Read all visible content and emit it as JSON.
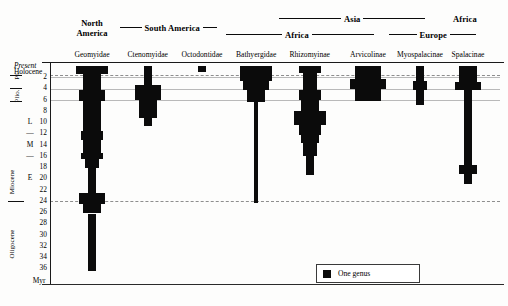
{
  "regions_row1": [
    {
      "label": "Asia",
      "rule_left": 62,
      "rule_right": 62,
      "center": 352,
      "top": 13
    },
    {
      "label": "Africa",
      "rule_left": 0,
      "rule_right": 0,
      "center": 465,
      "top": 13
    }
  ],
  "regions_row2": [
    {
      "label": "Africa",
      "rule_left": 56,
      "rule_right": 62,
      "center": 300,
      "top": 29
    },
    {
      "label": "Europe",
      "rule_left": 28,
      "rule_right": 26,
      "center": 432,
      "top": 29
    }
  ],
  "regions_row3": [
    {
      "label": "South America",
      "rule_left": 22,
      "rule_right": 14,
      "center": 168,
      "top": 22
    }
  ],
  "north_america": {
    "line1": "North",
    "line2": "America",
    "center": 92,
    "top": 19
  },
  "columns": [
    {
      "name": "Geomyidae",
      "center": 92
    },
    {
      "name": "Ctenomyidae",
      "center": 148
    },
    {
      "name": "Octodontidae",
      "center": 202
    },
    {
      "name": "Bathyergidae",
      "center": 256
    },
    {
      "name": "Rhizomyinae",
      "center": 310
    },
    {
      "name": "Arvicolinae",
      "center": 368
    },
    {
      "name": "Myospalacinae",
      "center": 420
    },
    {
      "name": "Spalacinae",
      "center": 468
    }
  ],
  "axis": {
    "unit": "Myr",
    "present": "Present",
    "holocene": "Holocene",
    "numeric_ticks": [
      2,
      4,
      6,
      8,
      10,
      12,
      14,
      16,
      18,
      20,
      22,
      24,
      26,
      28,
      30,
      32,
      34,
      36
    ],
    "epochs": [
      {
        "label": "Pl.",
        "rotated": true
      },
      {
        "label": "Plio.",
        "rotated": true
      },
      {
        "label": "Miocene",
        "rotated": true
      },
      {
        "label": "Oligocene",
        "rotated": true
      }
    ],
    "miocene_subdivisions": [
      {
        "label": "L",
        "at_myr": 10
      },
      {
        "label": "—",
        "at_myr": 12
      },
      {
        "label": "M",
        "at_myr": 14
      },
      {
        "label": "—",
        "at_myr": 16
      },
      {
        "label": "E",
        "at_myr": 20
      }
    ],
    "gridlines_myr": [
      2,
      4,
      6,
      24
    ],
    "holocene_gridline": true
  },
  "legend": {
    "swatch_label": "One genus"
  },
  "chart_data": {
    "type": "area",
    "title": "",
    "xlabel": "",
    "ylabel": "Myr",
    "ylim": [
      0,
      37
    ],
    "y_direction": "inverted",
    "unit": "Myr",
    "legend_note": "One genus",
    "categories": [
      "Geomyidae",
      "Ctenomyidae",
      "Octodontidae",
      "Bathyergidae",
      "Rhizomyinae",
      "Arvicolinae",
      "Myospalacinae",
      "Spalacinae"
    ],
    "regions": {
      "Geomyidae": "North America",
      "Ctenomyidae": "South America",
      "Octodontidae": "South America",
      "Bathyergidae": "Africa",
      "Rhizomyinae": "Africa/Asia",
      "Arvicolinae": "Asia",
      "Myospalacinae": "Asia/Europe",
      "Spalacinae": "Africa/Europe"
    },
    "series": [
      {
        "name": "Geomyidae",
        "center": 92,
        "spans": [
          {
            "from": 0.0,
            "to": 1.4,
            "genera": 7
          },
          {
            "from": 1.4,
            "to": 4.2,
            "genera": 4
          },
          {
            "from": 4.2,
            "to": 6.3,
            "genera": 6
          },
          {
            "from": 6.3,
            "to": 11.6,
            "genera": 4
          },
          {
            "from": 11.6,
            "to": 13.2,
            "genera": 5
          },
          {
            "from": 13.2,
            "to": 15.4,
            "genera": 4
          },
          {
            "from": 15.4,
            "to": 16.6,
            "genera": 5
          },
          {
            "from": 16.6,
            "to": 18.2,
            "genera": 3
          },
          {
            "from": 18.2,
            "to": 22.6,
            "genera": 2
          },
          {
            "from": 22.6,
            "to": 24.6,
            "genera": 6
          },
          {
            "from": 24.6,
            "to": 26.2,
            "genera": 4
          },
          {
            "from": 26.2,
            "to": 36.4,
            "genera": 2
          }
        ]
      },
      {
        "name": "Ctenomyidae",
        "center": 148,
        "spans": [
          {
            "from": 0.0,
            "to": 3.3,
            "genera": 2
          },
          {
            "from": 3.3,
            "to": 6.1,
            "genera": 6
          },
          {
            "from": 6.1,
            "to": 9.2,
            "genera": 4
          },
          {
            "from": 9.2,
            "to": 10.6,
            "genera": 2
          }
        ]
      },
      {
        "name": "Octodontidae",
        "center": 202,
        "spans": [
          {
            "from": 0.0,
            "to": 1.1,
            "genera": 2
          }
        ]
      },
      {
        "name": "Bathyergidae",
        "center": 256,
        "spans": [
          {
            "from": 0.0,
            "to": 2.6,
            "genera": 7
          },
          {
            "from": 2.6,
            "to": 4.3,
            "genera": 6
          },
          {
            "from": 4.3,
            "to": 6.4,
            "genera": 4
          },
          {
            "from": 6.4,
            "to": 24.3,
            "genera": 1
          }
        ]
      },
      {
        "name": "Rhizomyinae",
        "center": 310,
        "spans": [
          {
            "from": 0.0,
            "to": 1.3,
            "genera": 5
          },
          {
            "from": 1.3,
            "to": 4.2,
            "genera": 3
          },
          {
            "from": 4.2,
            "to": 6.0,
            "genera": 5
          },
          {
            "from": 6.0,
            "to": 8.0,
            "genera": 4
          },
          {
            "from": 8.0,
            "to": 10.4,
            "genera": 7
          },
          {
            "from": 10.4,
            "to": 12.3,
            "genera": 5
          },
          {
            "from": 12.3,
            "to": 13.6,
            "genera": 4
          },
          {
            "from": 13.6,
            "to": 16.0,
            "genera": 3
          },
          {
            "from": 16.0,
            "to": 19.4,
            "genera": 2
          }
        ]
      },
      {
        "name": "Arvicolinae",
        "center": 368,
        "spans": [
          {
            "from": 0.0,
            "to": 2.3,
            "genera": 6
          },
          {
            "from": 2.3,
            "to": 4.1,
            "genera": 8
          },
          {
            "from": 4.1,
            "to": 6.2,
            "genera": 6
          }
        ]
      },
      {
        "name": "Myospalacinae",
        "center": 420,
        "spans": [
          {
            "from": 0.0,
            "to": 2.6,
            "genera": 2
          },
          {
            "from": 2.6,
            "to": 4.3,
            "genera": 3
          },
          {
            "from": 4.3,
            "to": 7.0,
            "genera": 2
          }
        ]
      },
      {
        "name": "Spalacinae",
        "center": 468,
        "spans": [
          {
            "from": 0.0,
            "to": 2.8,
            "genera": 4
          },
          {
            "from": 2.8,
            "to": 4.2,
            "genera": 6
          },
          {
            "from": 4.2,
            "to": 17.6,
            "genera": 2
          },
          {
            "from": 17.6,
            "to": 19.2,
            "genera": 4
          },
          {
            "from": 19.2,
            "to": 21.0,
            "genera": 2
          }
        ]
      }
    ]
  }
}
